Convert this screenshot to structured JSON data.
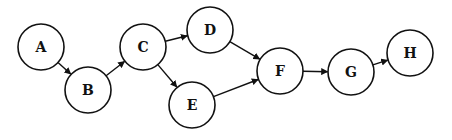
{
  "diagram": {
    "type": "directed-graph",
    "node_radius": 23,
    "stroke_color": "#111111",
    "fill_color": "#ffffff",
    "nodes": [
      {
        "id": "A",
        "label": "A",
        "x": 41,
        "y": 47
      },
      {
        "id": "B",
        "label": "B",
        "x": 88,
        "y": 90
      },
      {
        "id": "C",
        "label": "C",
        "x": 143,
        "y": 47
      },
      {
        "id": "D",
        "label": "D",
        "x": 210,
        "y": 30
      },
      {
        "id": "E",
        "label": "E",
        "x": 192,
        "y": 105
      },
      {
        "id": "F",
        "label": "F",
        "x": 280,
        "y": 71
      },
      {
        "id": "G",
        "label": "G",
        "x": 351,
        "y": 72
      },
      {
        "id": "H",
        "label": "H",
        "x": 410,
        "y": 53
      }
    ],
    "edges": [
      {
        "from": "A",
        "to": "B"
      },
      {
        "from": "B",
        "to": "C"
      },
      {
        "from": "C",
        "to": "D"
      },
      {
        "from": "C",
        "to": "E"
      },
      {
        "from": "D",
        "to": "F"
      },
      {
        "from": "E",
        "to": "F"
      },
      {
        "from": "F",
        "to": "G"
      },
      {
        "from": "G",
        "to": "H"
      }
    ]
  }
}
